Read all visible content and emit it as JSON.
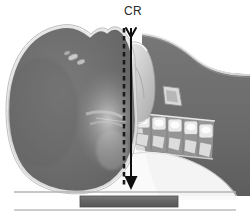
{
  "figure": {
    "annotations": {
      "central_ray_label": "CR"
    },
    "colors": {
      "background": "#ffffff",
      "soft_tissue": "#6d6d6d",
      "soft_tissue_dark": "#5e5e5e",
      "soft_tissue_light": "#8d8d8d",
      "skin_outline": "#cfcfcf",
      "bone_light": "#d8d8d8",
      "bone_highlight": "#f2f2f2",
      "air_white": "#fbfbfb",
      "arrow": "#111111",
      "dashed_line": "#1a1a1a",
      "table_line": "#b9b9b9",
      "receptor_bar": "#6a6a6a",
      "receptor_bar_edge": "#4a4a4a",
      "label_text": "#2b2b2b"
    },
    "elements": {
      "skull_label": "skull and facial soft tissue",
      "mandible_label": "mandible ramus",
      "cervical_spine_label": "cervical vertebrae",
      "posterior_neck_label": "posterior neck soft tissue",
      "hyoid_label": "hyoid bone",
      "table_top_label": "table surface line",
      "table_bottom_label": "table lower line",
      "receptor_label": "image receptor cassette"
    },
    "geometry": {
      "width": 250,
      "height": 217,
      "dashed_line_x": 124,
      "arrow_line_x": 131,
      "arrow_top_y": 26,
      "arrow_tip_y": 187,
      "table_line_top_y": 192,
      "table_line_bottom_y": 210,
      "receptor_x": 80,
      "receptor_y": 196,
      "receptor_width": 98,
      "receptor_height": 11
    }
  }
}
